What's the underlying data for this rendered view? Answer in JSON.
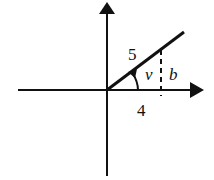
{
  "diagram": {
    "type": "right-triangle-on-axes",
    "labels": {
      "hypotenuse": "5",
      "angle": "v",
      "opposite": "b",
      "adjacent": "4"
    },
    "colors": {
      "stroke": "#111111",
      "background": "#ffffff"
    }
  }
}
